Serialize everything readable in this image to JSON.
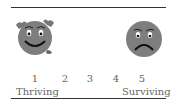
{
  "scale": {
    "numbers": [
      "1",
      "2",
      "3",
      "4",
      "5"
    ],
    "left_label": "Thriving",
    "right_label": "Surviving"
  },
  "icons": {
    "left": "happy-face-icon",
    "right": "sad-face-icon"
  },
  "colors": {
    "face": "#7a7a7a",
    "rule": "#333333"
  }
}
